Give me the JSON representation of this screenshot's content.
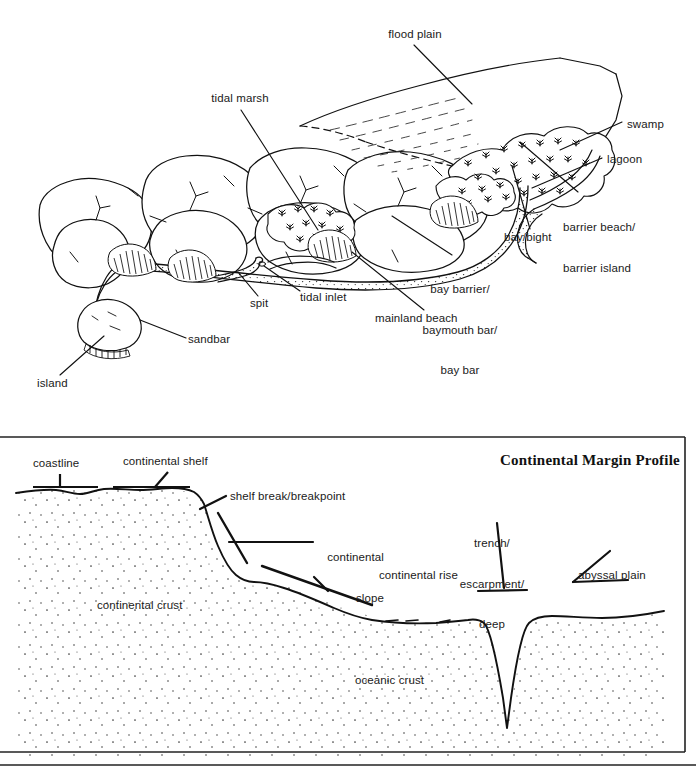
{
  "figure": {
    "panels": [
      {
        "id": "coastal-landforms",
        "labels": [
          {
            "key": "flood_plain",
            "text": "flood plain"
          },
          {
            "key": "tidal_marsh",
            "text": "tidal marsh"
          },
          {
            "key": "swamp",
            "text": "swamp"
          },
          {
            "key": "lagoon",
            "text": "lagoon"
          },
          {
            "key": "barrier_beach",
            "line1": "barrier beach/",
            "line2": "barrier island"
          },
          {
            "key": "bay_bight",
            "text": "bay/bight"
          },
          {
            "key": "bay_barrier",
            "line1": "bay barrier/",
            "line2": "baymouth bar/",
            "line3": "bay bar"
          },
          {
            "key": "mainland_beach",
            "text": "mainland beach"
          },
          {
            "key": "tidal_inlet",
            "text": "tidal inlet"
          },
          {
            "key": "spit",
            "text": "spit"
          },
          {
            "key": "sandbar",
            "text": "sandbar"
          },
          {
            "key": "island",
            "text": "island"
          }
        ]
      },
      {
        "id": "continental-margin",
        "title": "Continental Margin Profile",
        "labels": [
          {
            "key": "coastline",
            "text": "coastline"
          },
          {
            "key": "continental_shelf",
            "text": "continental shelf"
          },
          {
            "key": "shelf_break",
            "text": "shelf break/breakpoint"
          },
          {
            "key": "continental_slope",
            "line1": "continental",
            "line2": "slope"
          },
          {
            "key": "continental_rise",
            "text": "continental rise"
          },
          {
            "key": "trench",
            "line1": "trench/",
            "line2": "escarpment/",
            "line3": "deep"
          },
          {
            "key": "abyssal_plain",
            "text": "abyssal plain"
          },
          {
            "key": "continental_crust",
            "text": "continental crust"
          },
          {
            "key": "oceanic_crust",
            "text": "oceanic crust"
          }
        ]
      }
    ]
  },
  "coastal": {
    "flood_plain": "flood plain",
    "tidal_marsh": "tidal marsh",
    "swamp": "swamp",
    "lagoon": "lagoon",
    "barrier_beach_l1": "barrier beach/",
    "barrier_beach_l2": "barrier island",
    "bay_bight": "bay/bight",
    "bay_barrier_l1": "bay barrier/",
    "bay_barrier_l2": "baymouth bar/",
    "bay_barrier_l3": "bay bar",
    "mainland_beach": "mainland beach",
    "tidal_inlet": "tidal inlet",
    "spit": "spit",
    "sandbar": "sandbar",
    "island": "island"
  },
  "margin": {
    "title": "Continental Margin Profile",
    "coastline": "coastline",
    "continental_shelf": "continental shelf",
    "shelf_break": "shelf break/breakpoint",
    "continental_slope_l1": "continental",
    "continental_slope_l2": "slope",
    "continental_rise": "continental rise",
    "trench_l1": "trench/",
    "trench_l2": "escarpment/",
    "trench_l3": "deep",
    "abyssal_plain": "abyssal plain",
    "continental_crust": "continental crust",
    "oceanic_crust": "oceanic crust"
  },
  "colors": {
    "ink": "#1a1a1a",
    "paper": "#ffffff",
    "stipple": "#555555",
    "border": "#222222"
  }
}
